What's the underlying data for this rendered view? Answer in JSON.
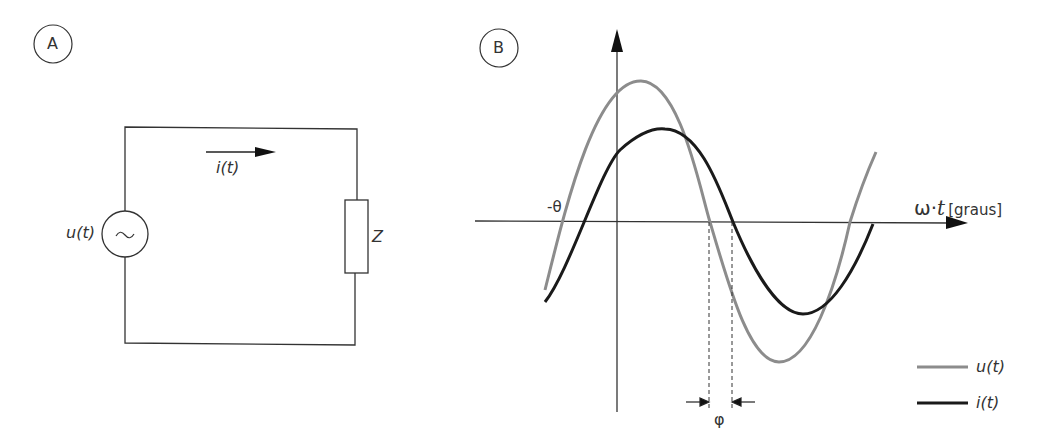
{
  "panel_a": {
    "badge": "A",
    "voltage_label": "u(t)",
    "current_label": "i(t)",
    "impedance_label": "Z",
    "source_symbol": "~"
  },
  "panel_b": {
    "badge": "B",
    "theta_label": "-θ",
    "x_axis_label_omega": "ω·",
    "x_axis_label_t": "t",
    "x_axis_unit": "[graus]",
    "phi_label": "φ",
    "legend": [
      {
        "label": "u(t)",
        "color": "#8c8c8c"
      },
      {
        "label": "i(t)",
        "color": "#1a1a1a"
      }
    ]
  },
  "colors": {
    "voltage": "#8c8c8c",
    "current": "#1a1a1a",
    "wire": "#333333"
  }
}
